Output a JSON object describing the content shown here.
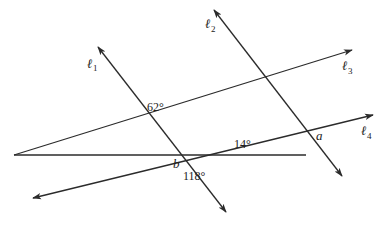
{
  "diagram": {
    "type": "geometry-lines-and-angles",
    "lines": [
      {
        "id": "l1",
        "label": "ℓ",
        "subscript": "1"
      },
      {
        "id": "l2",
        "label": "ℓ",
        "subscript": "2"
      },
      {
        "id": "l3",
        "label": "ℓ",
        "subscript": "3"
      },
      {
        "id": "l4",
        "label": "ℓ",
        "subscript": "4"
      }
    ],
    "angles": {
      "a1": "62°",
      "a2": "118°",
      "a3": "14°"
    },
    "variables": {
      "a": "a",
      "b": "b"
    },
    "colors": {
      "line": "#2b2b2b",
      "background": "#ffffff"
    }
  }
}
